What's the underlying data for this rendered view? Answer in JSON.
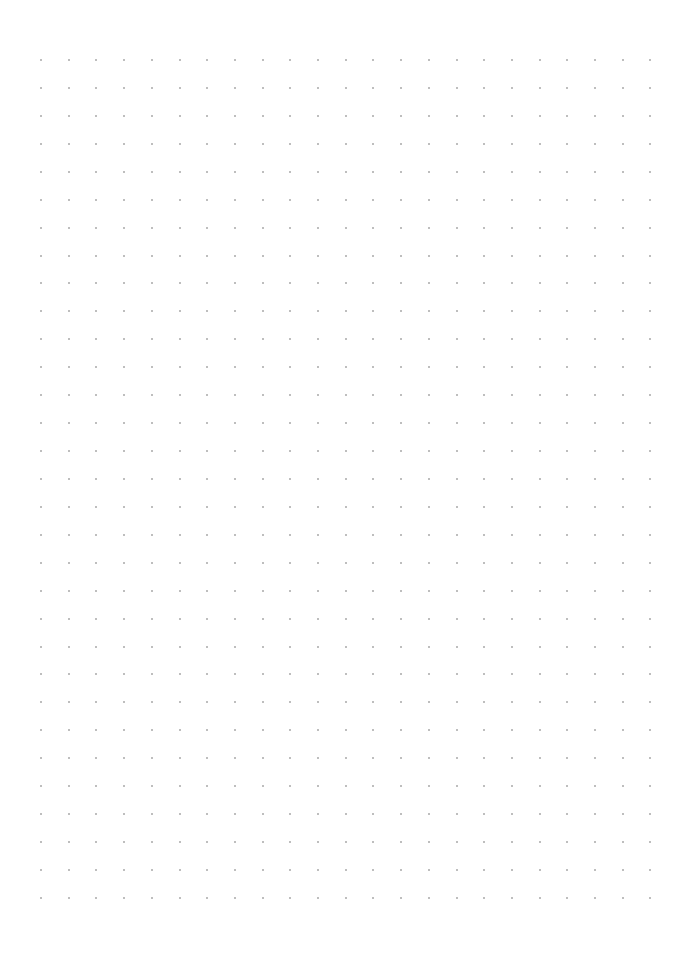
{
  "page": {
    "type": "dot-grid-paper",
    "background_color": "#ffffff",
    "width": 677,
    "height": 960
  },
  "grid": {
    "columns": 23,
    "rows": 31,
    "origin_x": 41,
    "origin_y": 60,
    "spacing_x": 27.7,
    "spacing_y": 27.93,
    "dot_size": 2,
    "dot_color": "#a8a8a8"
  }
}
